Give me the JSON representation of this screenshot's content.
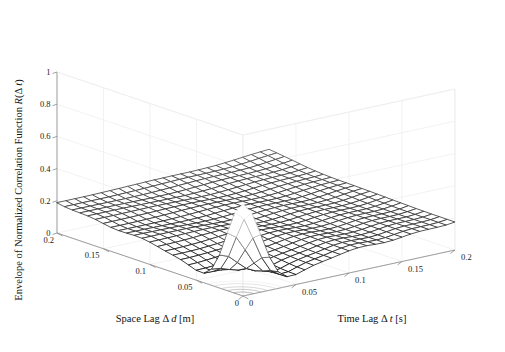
{
  "figure": {
    "background": "#ffffff",
    "type": "matlab-mesh-3d"
  },
  "axes": {
    "z": {
      "title": "Envelope of Normalized Correlation Function R(Δ t)",
      "title_plain": "Envelope of Normalized Correlation Function R(",
      "title_italic": "R",
      "ticks": [
        "1",
        "0.8",
        "0.6",
        "0.4",
        "0.2",
        "0"
      ],
      "tick_values": [
        1,
        0.8,
        0.6,
        0.4,
        0.2,
        0
      ],
      "range": [
        0,
        1
      ]
    },
    "space": {
      "title_prefix": "Space Lag Δ ",
      "title_italic": "d",
      "title_suffix": " [m]",
      "title_full": "Space Lag Δ d [m]",
      "ticks": [
        "0.2",
        "0.15",
        "0.1",
        "0.05",
        "0"
      ],
      "tick_values": [
        0.2,
        0.15,
        0.1,
        0.05,
        0
      ],
      "range": [
        0,
        0.2
      ],
      "unit": "m"
    },
    "time": {
      "title_prefix": "Time Lag Δ ",
      "title_italic": "t",
      "title_suffix": " [s]",
      "title_full": "Time Lag Δ t [s]",
      "ticks": [
        "0",
        "0.05",
        "0.1",
        "0.15",
        "0.2"
      ],
      "tick_values": [
        0,
        0.05,
        0.1,
        0.15,
        0.2
      ],
      "range": [
        0,
        0.2
      ],
      "unit": "s"
    }
  },
  "colors": {
    "axis": "#8a8a8a",
    "grid": "#ececec",
    "mesh_low": "#0d0d0d",
    "mesh_high": "#f2f2f2",
    "text": "#111111",
    "contour": "#9a9a9a"
  },
  "chart_data": {
    "type": "surface",
    "title": "",
    "xlabel": "Time Lag Δ t [s]",
    "ylabel": "Space Lag Δ d [m]",
    "zlabel": "Envelope of Normalized Correlation Function R(Δ t)",
    "xlim": [
      0,
      0.2
    ],
    "ylim": [
      0,
      0.2
    ],
    "zlim": [
      0,
      1
    ],
    "grid": true,
    "legend": null,
    "colormap": "gray",
    "mesh_n_x": 24,
    "mesh_n_y": 24,
    "peak": {
      "x": 0.0,
      "y": 0.0,
      "z": 0.47,
      "description": "sharp central peak at zero time lag and zero space lag, value about 0.47"
    },
    "plateau": {
      "z": 0.13,
      "description": "broad low plateau around 0.12-0.15 across most of the domain"
    },
    "ridge": {
      "z": 0.2,
      "description": "raised ridge along the far edges rising to about 0.2"
    },
    "trough": {
      "z": 0.04,
      "description": "trough band surrounding the central peak dipping to about 0.04"
    },
    "model": {
      "note": "z = peak*exp(-((x/ax)^2+(y/ay)^2)) + plateau terms",
      "peak_amp": 0.47,
      "peak_sigma_x": 0.018,
      "peak_sigma_y": 0.018,
      "base_amp": 0.135,
      "ridge_amp": 0.075,
      "trough_depth": 0.085
    },
    "surface_samples": {
      "description": "z values on an 11x11 grid, rows = space lag 0..0.2, cols = time lag 0..0.2",
      "space_grid": [
        0,
        0.02,
        0.04,
        0.06,
        0.08,
        0.1,
        0.12,
        0.14,
        0.16,
        0.18,
        0.2
      ],
      "time_grid": [
        0,
        0.02,
        0.04,
        0.06,
        0.08,
        0.1,
        0.12,
        0.14,
        0.16,
        0.18,
        0.2
      ],
      "z": [
        [
          0.47,
          0.19,
          0.05,
          0.07,
          0.11,
          0.13,
          0.14,
          0.14,
          0.15,
          0.17,
          0.2
        ],
        [
          0.19,
          0.12,
          0.05,
          0.07,
          0.11,
          0.13,
          0.14,
          0.14,
          0.15,
          0.17,
          0.19
        ],
        [
          0.05,
          0.05,
          0.04,
          0.07,
          0.1,
          0.12,
          0.13,
          0.14,
          0.15,
          0.16,
          0.18
        ],
        [
          0.07,
          0.07,
          0.07,
          0.09,
          0.11,
          0.12,
          0.13,
          0.14,
          0.15,
          0.16,
          0.18
        ],
        [
          0.11,
          0.11,
          0.1,
          0.11,
          0.12,
          0.13,
          0.13,
          0.14,
          0.15,
          0.16,
          0.18
        ],
        [
          0.13,
          0.13,
          0.12,
          0.12,
          0.13,
          0.13,
          0.14,
          0.14,
          0.15,
          0.16,
          0.18
        ],
        [
          0.14,
          0.14,
          0.13,
          0.13,
          0.13,
          0.14,
          0.14,
          0.15,
          0.15,
          0.16,
          0.18
        ],
        [
          0.14,
          0.14,
          0.14,
          0.14,
          0.14,
          0.14,
          0.15,
          0.15,
          0.16,
          0.17,
          0.18
        ],
        [
          0.15,
          0.15,
          0.15,
          0.15,
          0.15,
          0.15,
          0.15,
          0.16,
          0.16,
          0.17,
          0.19
        ],
        [
          0.17,
          0.17,
          0.16,
          0.16,
          0.16,
          0.16,
          0.16,
          0.17,
          0.17,
          0.18,
          0.19
        ],
        [
          0.2,
          0.19,
          0.18,
          0.18,
          0.18,
          0.18,
          0.18,
          0.18,
          0.19,
          0.19,
          0.2
        ]
      ]
    },
    "contour_base": {
      "present": true,
      "description": "filled gray contour of the central peak drawn on the z=0 floor near the origin corner",
      "levels": [
        0.05,
        0.1,
        0.2,
        0.3,
        0.4
      ]
    }
  }
}
